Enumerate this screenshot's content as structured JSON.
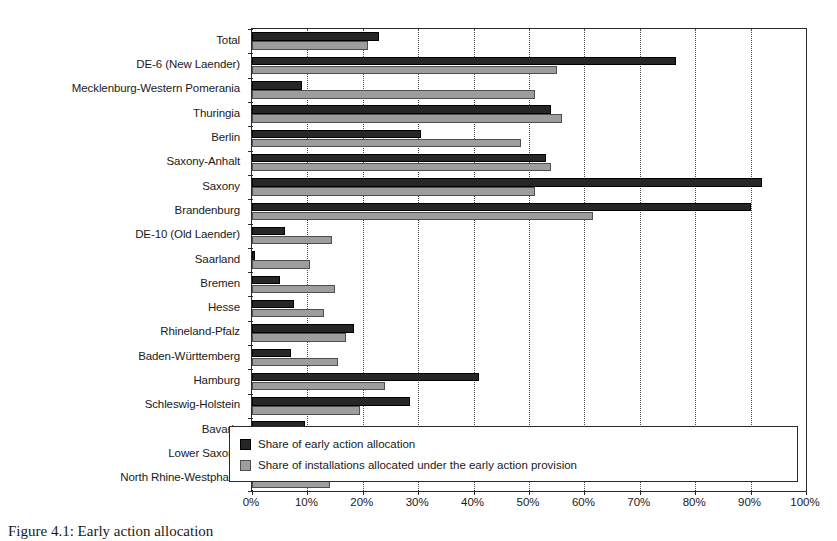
{
  "chart_data": {
    "type": "bar",
    "orientation": "horizontal",
    "title": "",
    "xlabel": "",
    "ylabel": "",
    "xlim": [
      0,
      100
    ],
    "xtick_labels": [
      "0%",
      "10%",
      "20%",
      "30%",
      "40%",
      "50%",
      "60%",
      "70%",
      "80%",
      "90%",
      "100%"
    ],
    "xtick_values": [
      0,
      10,
      20,
      30,
      40,
      50,
      60,
      70,
      80,
      90,
      100
    ],
    "grid": "vertical-dotted",
    "legend_position": "inside-bottom-right",
    "categories": [
      "Total",
      "DE-6 (New Laender)",
      "Mecklenburg-Western Pomerania",
      "Thuringia",
      "Berlin",
      "Saxony-Anhalt",
      "Saxony",
      "Brandenburg",
      "DE-10 (Old Laender)",
      "Saarland",
      "Bremen",
      "Hesse",
      "Rhineland-Pfalz",
      "Baden-Württemberg",
      "Hamburg",
      "Schleswig-Holstein",
      "Bavaria",
      "Lower Saxony",
      "North Rhine-Westphalia"
    ],
    "series": [
      {
        "name": "Share of early action allocation",
        "color": "#262626",
        "values": [
          23.0,
          76.5,
          9.0,
          54.0,
          30.5,
          53.0,
          92.0,
          90.0,
          6.0,
          0.5,
          5.0,
          7.5,
          18.5,
          7.0,
          41.0,
          28.5,
          9.5,
          8.5,
          3.0
        ]
      },
      {
        "name": "Share of installations allocated under the early action provision",
        "color": "#9d9d9d",
        "values": [
          21.0,
          55.0,
          51.0,
          56.0,
          48.5,
          54.0,
          51.0,
          61.5,
          14.5,
          10.5,
          15.0,
          13.0,
          17.0,
          15.5,
          24.0,
          19.5,
          11.0,
          12.5,
          14.0
        ]
      }
    ]
  },
  "legend": {
    "entries": [
      {
        "label": "Share of early action allocation",
        "swatch": "dark-square-swatch"
      },
      {
        "label": "Share of installations allocated under the early action provision",
        "swatch": "light-square-swatch"
      }
    ]
  },
  "caption": {
    "text": "Figure 4.1: Early action allocation"
  }
}
